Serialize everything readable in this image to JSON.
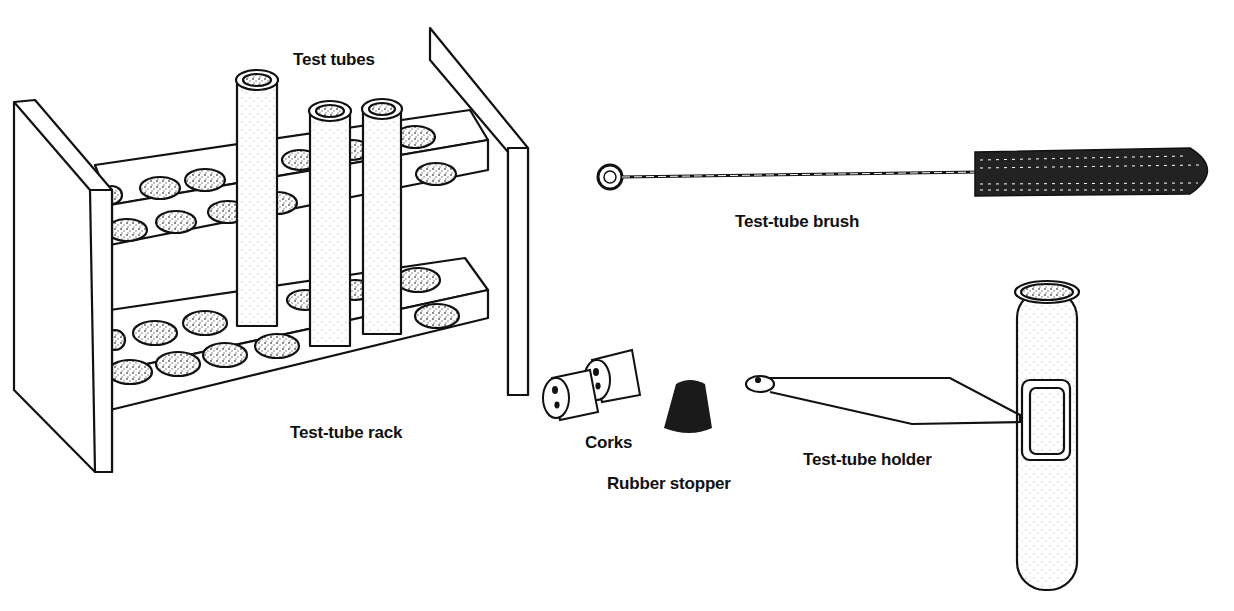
{
  "diagram": {
    "colors": {
      "ink": "#111111",
      "paper": "#ffffff",
      "stipple": "#8a8a8a",
      "stopper": "#1a1a1a"
    },
    "labels": {
      "test_tubes": "Test tubes",
      "test_tube_rack": "Test-tube rack",
      "test_tube_brush": "Test-tube brush",
      "corks": "Corks",
      "rubber_stopper": "Rubber stopper",
      "test_tube_holder": "Test-tube holder"
    },
    "items": [
      {
        "id": "test-tube-rack",
        "label": "Test-tube rack",
        "detail": "two-tier rack, 3 test tubes inserted"
      },
      {
        "id": "test-tubes",
        "label": "Test tubes"
      },
      {
        "id": "test-tube-brush",
        "label": "Test-tube brush"
      },
      {
        "id": "corks",
        "label": "Corks",
        "count": 2
      },
      {
        "id": "rubber-stopper",
        "label": "Rubber stopper"
      },
      {
        "id": "test-tube-holder",
        "label": "Test-tube holder",
        "detail": "wire clamp holding a test tube"
      }
    ]
  }
}
